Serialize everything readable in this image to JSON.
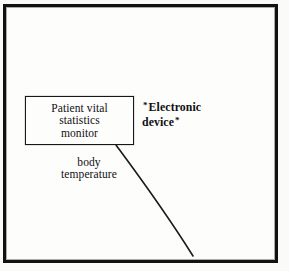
{
  "diagram": {
    "frame": {
      "name": "outer-border",
      "color": "#121212"
    },
    "monitor_box": {
      "lines": [
        "Patient vital",
        "statistics",
        "monitor"
      ],
      "border_color": "#18181a"
    },
    "edge_label": {
      "lines": [
        "body",
        "temperature"
      ]
    },
    "device_annotation": {
      "mark_left": "*",
      "line1": "Electronic",
      "line2": "device",
      "mark_right": "*"
    },
    "connector": {
      "name": "leader-line",
      "color": "#1a1a1c",
      "from": "monitor-box-bottom-right",
      "to": "lower-right"
    },
    "background_color": "#fbfbfa"
  }
}
